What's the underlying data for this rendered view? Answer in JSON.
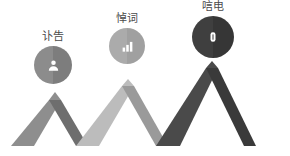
{
  "canvas": {
    "width": 290,
    "height": 156,
    "background": "#ffffff"
  },
  "title": "",
  "nodes": [
    {
      "id": "node-1",
      "label": "讣告",
      "icon": "user-icon",
      "badge_color_left": "#8c8c8c",
      "badge_color_right": "#7d7d7d",
      "icon_color": "#ffffff",
      "label_color": "#4a4a4a"
    },
    {
      "id": "node-2",
      "label": "悼词",
      "icon": "bar-chart-icon",
      "badge_color_left": "#ababab",
      "badge_color_right": "#a0a0a0",
      "icon_color": "#ffffff",
      "label_color": "#4a4a4a"
    },
    {
      "id": "node-3",
      "label": "唁电",
      "icon": "document-icon",
      "badge_color_left": "#3f3f3f",
      "badge_color_right": "#363636",
      "icon_color": "#ffffff",
      "label_color": "#4a4a4a"
    }
  ],
  "chevrons": [
    {
      "id": "chevron-1",
      "color_left": "#8e8e8e",
      "color_right": "#6e6e6e"
    },
    {
      "id": "chevron-2",
      "color_left": "#bcbcbc",
      "color_right": "#9a9a9a"
    },
    {
      "id": "chevron-3",
      "color_left": "#4a4a4a",
      "color_right": "#3a3a3a"
    }
  ]
}
